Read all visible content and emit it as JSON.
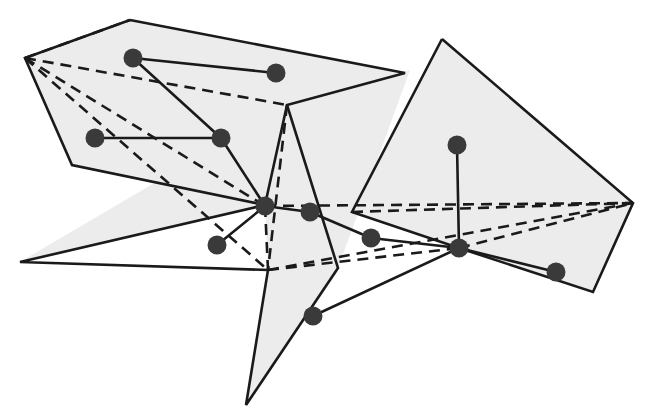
{
  "figure": {
    "type": "diagram",
    "width": 657,
    "height": 416,
    "background_color": "#ffffff",
    "style": {
      "region_fill": "#ececec",
      "region_stroke": "#1a1a1a",
      "region_stroke_width": 2.6,
      "solid_edge_color": "#1a1a1a",
      "solid_edge_width": 2.6,
      "dashed_edge_color": "#1a1a1a",
      "dashed_edge_width": 2.6,
      "dash_pattern": "11 7",
      "node_fill": "#3a3a3a",
      "node_stroke": "#111111",
      "node_radius": 9.5
    },
    "regions": [
      {
        "name": "upper-left-region",
        "points": "130,20 405,73 287,105 265,205 72,165 25,58"
      },
      {
        "name": "lower-left-region",
        "points": "265,205 268,270 246,405 338,268 410,70 287,105 20,262"
      },
      {
        "name": "right-region",
        "points": "442,39 633,203 593,292 459,248 352,212"
      },
      {
        "name": "lower-right-region",
        "points": "459,248 633,203 593,292"
      }
    ],
    "region_outlines": [
      {
        "name": "upper-left-outline",
        "points": "130,20 405,73 287,105 265,205 72,165 25,58 130,20"
      },
      {
        "name": "center-spur-outline",
        "points": "287,105 338,268 246,405 268,270 20,262 265,205"
      },
      {
        "name": "right-outline",
        "points": "442,39 633,203 593,292 459,248 352,212 442,39"
      }
    ],
    "nodes": [
      {
        "name": "node-upper-left-a",
        "x": 133,
        "y": 58,
        "label": "n1"
      },
      {
        "name": "node-upper-left-b",
        "x": 276,
        "y": 73,
        "label": "n2"
      },
      {
        "name": "node-mid-left-a",
        "x": 95,
        "y": 138,
        "label": "n3"
      },
      {
        "name": "node-mid-left-b",
        "x": 221,
        "y": 138,
        "label": "n4"
      },
      {
        "name": "node-hub-center",
        "x": 265,
        "y": 206,
        "label": "n5"
      },
      {
        "name": "node-center-right",
        "x": 310,
        "y": 212,
        "label": "n6"
      },
      {
        "name": "node-lower-left",
        "x": 217,
        "y": 245,
        "label": "n7"
      },
      {
        "name": "node-bottom",
        "x": 313,
        "y": 316,
        "label": "n8"
      },
      {
        "name": "node-right-upper",
        "x": 457,
        "y": 145,
        "label": "n9"
      },
      {
        "name": "node-right-mid",
        "x": 371,
        "y": 238,
        "label": "n10"
      },
      {
        "name": "node-hub-right",
        "x": 459,
        "y": 248,
        "label": "n11"
      },
      {
        "name": "node-far-right",
        "x": 556,
        "y": 272,
        "label": "n12"
      }
    ],
    "solid_edges": [
      {
        "name": "edge-n1-n2",
        "x1": 133,
        "y1": 58,
        "x2": 276,
        "y2": 73
      },
      {
        "name": "edge-n1-n4",
        "x1": 133,
        "y1": 58,
        "x2": 221,
        "y2": 138
      },
      {
        "name": "edge-n3-n4",
        "x1": 95,
        "y1": 138,
        "x2": 221,
        "y2": 138
      },
      {
        "name": "edge-n4-n5",
        "x1": 221,
        "y1": 138,
        "x2": 265,
        "y2": 206
      },
      {
        "name": "edge-n5-n6",
        "x1": 265,
        "y1": 206,
        "x2": 310,
        "y2": 212
      },
      {
        "name": "edge-n5-n7",
        "x1": 265,
        "y1": 206,
        "x2": 217,
        "y2": 245
      },
      {
        "name": "edge-n6-n10",
        "x1": 310,
        "y1": 212,
        "x2": 371,
        "y2": 238
      },
      {
        "name": "edge-n10-n11",
        "x1": 371,
        "y1": 238,
        "x2": 459,
        "y2": 248
      },
      {
        "name": "edge-n9-n11",
        "x1": 457,
        "y1": 145,
        "x2": 459,
        "y2": 248
      },
      {
        "name": "edge-n11-n12",
        "x1": 459,
        "y1": 248,
        "x2": 556,
        "y2": 272
      },
      {
        "name": "edge-n11-n8",
        "x1": 459,
        "y1": 248,
        "x2": 313,
        "y2": 316
      }
    ],
    "dashed_edges": [
      {
        "name": "dashed-corner-to-apex",
        "x1": 25,
        "y1": 58,
        "x2": 130,
        "y2": 20
      },
      {
        "name": "dashed-corner-to-reflex",
        "x1": 25,
        "y1": 58,
        "x2": 287,
        "y2": 105
      },
      {
        "name": "dashed-corner-to-hub",
        "x1": 25,
        "y1": 58,
        "x2": 265,
        "y2": 206
      },
      {
        "name": "dashed-corner-to-notch",
        "x1": 25,
        "y1": 58,
        "x2": 268,
        "y2": 270
      },
      {
        "name": "dashed-reflex-to-notch",
        "x1": 287,
        "y1": 105,
        "x2": 268,
        "y2": 270
      },
      {
        "name": "dashed-hub-to-notch",
        "x1": 265,
        "y1": 206,
        "x2": 268,
        "y2": 270
      },
      {
        "name": "dashed-notch-to-righthub",
        "x1": 268,
        "y1": 270,
        "x2": 459,
        "y2": 248
      },
      {
        "name": "dashed-notch-to-rightvtx",
        "x1": 268,
        "y1": 270,
        "x2": 633,
        "y2": 203
      },
      {
        "name": "dashed-hub-to-rightvtx",
        "x1": 265,
        "y1": 206,
        "x2": 633,
        "y2": 203
      },
      {
        "name": "dashed-righthub-to-rightvtx",
        "x1": 459,
        "y1": 248,
        "x2": 633,
        "y2": 203
      },
      {
        "name": "dashed-lefttip-to-rightvtx",
        "x1": 352,
        "y1": 212,
        "x2": 633,
        "y2": 203
      }
    ]
  }
}
